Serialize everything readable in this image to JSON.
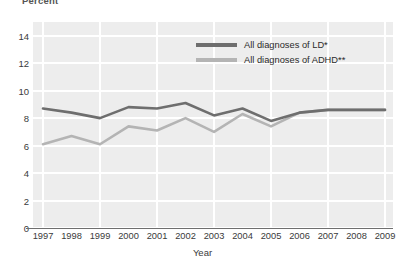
{
  "chart_data": {
    "type": "line",
    "title": "",
    "ylabel": "Percent",
    "xlabel": "Year",
    "ylim": [
      0,
      15
    ],
    "yticks": [
      0,
      2,
      4,
      6,
      8,
      10,
      12,
      14
    ],
    "grid": true,
    "legend_position": "top-right",
    "categories": [
      "1997",
      "1998",
      "1999",
      "2000",
      "2001",
      "2002",
      "2003",
      "2004",
      "2005",
      "2006",
      "2007",
      "2008",
      "2009"
    ],
    "x": [
      1997,
      1998,
      1999,
      2000,
      2001,
      2002,
      2003,
      2004,
      2005,
      2006,
      2007,
      2008,
      2009
    ],
    "series": [
      {
        "name": "All diagnoses of LD*",
        "color": "#6e6e6e",
        "values": [
          8.7,
          8.4,
          8.0,
          8.8,
          8.7,
          9.1,
          8.2,
          8.7,
          7.8,
          8.4,
          8.6,
          8.6,
          8.6
        ]
      },
      {
        "name": "All diagnoses of ADHD**",
        "color": "#b4b4b4",
        "values": [
          6.1,
          6.7,
          6.1,
          7.4,
          7.1,
          8.0,
          7.0,
          8.3,
          7.4,
          8.4,
          8.6,
          8.6,
          8.6
        ]
      }
    ]
  },
  "axis": {
    "y_title": "Percent",
    "x_title": "Year"
  },
  "legend": {
    "items": [
      {
        "label": "All diagnoses of LD*",
        "color": "#6e6e6e"
      },
      {
        "label": "All diagnoses of ADHD**",
        "color": "#b4b4b4"
      }
    ]
  },
  "colors": {
    "plot_background": "#ededed",
    "gridline": "#ffffff",
    "axis_line": "#6f6f6f",
    "series_ld": "#6e6e6e",
    "series_adhd": "#b4b4b4"
  }
}
